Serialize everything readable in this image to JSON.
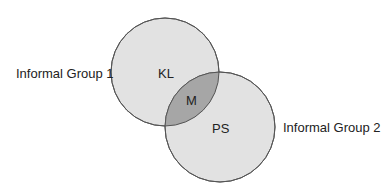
{
  "diagram": {
    "type": "venn",
    "sets": [
      {
        "id": "group1",
        "label": "Informal Group 1",
        "region_label": "KL"
      },
      {
        "id": "group2",
        "label": "Informal Group 2",
        "region_label": "PS"
      }
    ],
    "intersection_label": "M",
    "colors": {
      "circle_fill": "#e2e2e2",
      "intersection_fill": "#a6a6a6",
      "stroke": "#555555"
    }
  }
}
